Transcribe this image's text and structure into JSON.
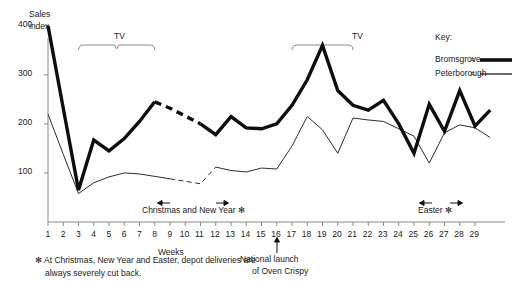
{
  "chart_data": {
    "type": "line",
    "title": "",
    "xlabel": "Weeks",
    "ylabel": "Sales index",
    "xlim": [
      0.5,
      30
    ],
    "ylim": [
      0,
      420
    ],
    "yticks": [
      100,
      200,
      300,
      400
    ],
    "grid": false,
    "legend_position": "top-right",
    "x": [
      1,
      2,
      3,
      4,
      5,
      6,
      7,
      8,
      9,
      10,
      11,
      12,
      13,
      14,
      15,
      16,
      17,
      18,
      19,
      20,
      21,
      22,
      23,
      24,
      25,
      26,
      27,
      28,
      29,
      30
    ],
    "series": [
      {
        "name": "Bromsgrove",
        "style": "thick-solid-with-dashed-gap",
        "dashed_x_range": [
          8,
          11
        ],
        "values": [
          400,
          232,
          65,
          167,
          145,
          170,
          205,
          245,
          232,
          216,
          200,
          178,
          215,
          192,
          190,
          200,
          238,
          290,
          360,
          268,
          238,
          228,
          248,
          200,
          140,
          240,
          185,
          268,
          196,
          228
        ]
      },
      {
        "name": "Peterborough",
        "style": "thin-solid-with-dashed-gap",
        "dashed_x_range": [
          9,
          12
        ],
        "values": [
          220,
          138,
          58,
          80,
          92,
          100,
          98,
          93,
          88,
          83,
          78,
          112,
          105,
          102,
          110,
          108,
          155,
          215,
          188,
          140,
          212,
          208,
          205,
          190,
          175,
          120,
          182,
          198,
          192,
          172
        ]
      }
    ],
    "annotations": [
      {
        "name": "tv-burst-1",
        "label": "TV",
        "x_start": 3,
        "x_end": 8
      },
      {
        "name": "tv-burst-2",
        "label": "TV",
        "x_start": 17,
        "x_end": 21
      },
      {
        "name": "christmas",
        "label": "Christmas and New Year *",
        "x_start": 8.5,
        "x_end": 11
      },
      {
        "name": "easter",
        "label": "Easter *",
        "x_start": 24,
        "x_end": 26
      },
      {
        "name": "launch",
        "label": "National launch\nof Oven Crispy",
        "x": 17
      }
    ]
  },
  "axis": {
    "y_title_line1": "Sales",
    "y_title_line2": "index",
    "y_ticks": [
      "400",
      "300",
      "200",
      "100"
    ],
    "x_title": "Weeks",
    "x_ticks": [
      "1",
      "2",
      "3",
      "4",
      "5",
      "6",
      "7",
      "8",
      "9",
      "10",
      "11",
      "12",
      "13",
      "14",
      "15",
      "16",
      "17",
      "18",
      "19",
      "20",
      "21",
      "22",
      "23",
      "24",
      "25",
      "26",
      "27",
      "28",
      "29"
    ]
  },
  "legend": {
    "title": "Key:",
    "entries": [
      {
        "label": "Bromsgrove",
        "separator": "=",
        "swatch": "thick-black-line"
      },
      {
        "label": "Peterborough",
        "separator": "=",
        "swatch": "thin-grey-line"
      }
    ]
  },
  "markers": {
    "tv_label_1": "TV",
    "tv_label_2": "TV",
    "christmas_label": "Christmas and New Year ✻",
    "easter_label": "Easter ✻",
    "launch_label_line1": "National launch",
    "launch_label_line2": "of Oven Crispy"
  },
  "footnote": {
    "line1": "✻ At Christmas, New Year and Easter, depot deliveries are",
    "line2": "always severely cut back."
  },
  "colors": {
    "bromsgrove": "#0d0d0d",
    "peterborough": "#4a4a4a",
    "axis": "#8a8a8a",
    "text": "#1a1a1a",
    "background": "#ffffff"
  }
}
